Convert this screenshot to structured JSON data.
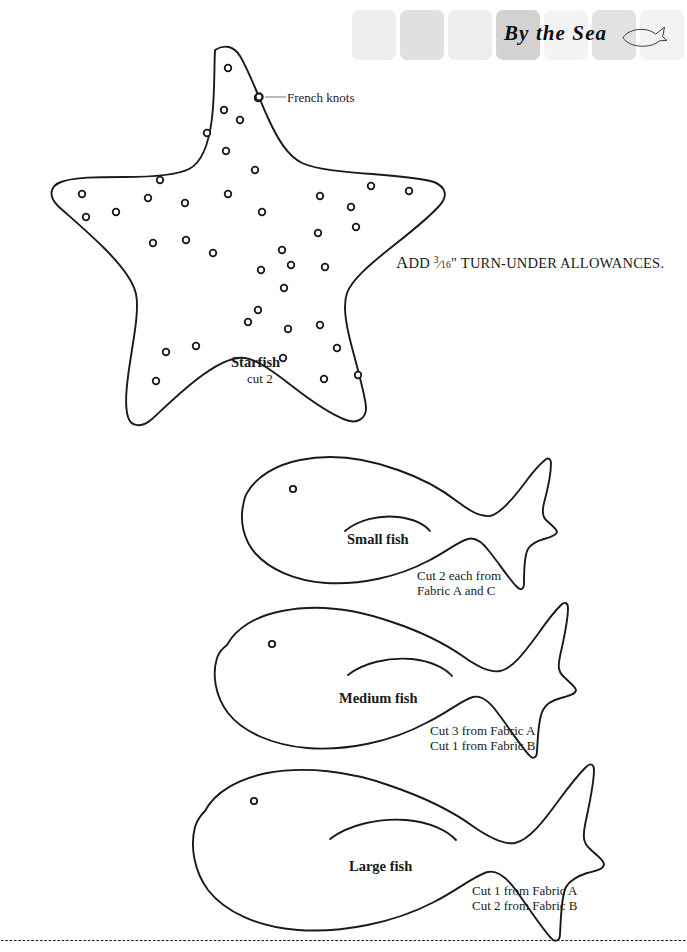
{
  "header": {
    "title": "By the Sea",
    "logo_icon": "fish-icon",
    "squares": [
      {
        "color": "#eeeeee",
        "x": 0
      },
      {
        "color": "#e0e0e0",
        "x": 48
      },
      {
        "color": "#ededed",
        "x": 96
      },
      {
        "color": "#d2d2d2",
        "x": 144
      },
      {
        "color": "#f4f4f4",
        "x": 192
      },
      {
        "color": "#e2e2e2",
        "x": 240
      },
      {
        "color": "#f2f2f2",
        "x": 288
      }
    ]
  },
  "notes": {
    "allowance_prefix": "A",
    "allowance_word": "DD",
    "allowance_fraction_num": "3",
    "allowance_fraction_den": "16",
    "allowance_inch": "\"",
    "allowance_suffix": "TURN-UNDER ALLOWANCES.",
    "french_knots": "French knots"
  },
  "patterns": [
    {
      "id": "starfish",
      "name": "Starfish",
      "cut_lines": [
        "cut 2"
      ],
      "marking": "french-knots"
    },
    {
      "id": "small-fish",
      "name": "Small fish",
      "cut_lines": [
        "Cut 2 each from",
        "Fabric A and C"
      ]
    },
    {
      "id": "medium-fish",
      "name": "Medium fish",
      "cut_lines": [
        "Cut 3 from Fabric A",
        "Cut 1 from Fabric B"
      ]
    },
    {
      "id": "large-fish",
      "name": "Large fish",
      "cut_lines": [
        "Cut 1 from Fabric A",
        "Cut 2 from Fabric B"
      ]
    }
  ],
  "colors": {
    "ink": "#1a1a1a",
    "paper": "#ffffff",
    "leader_line": "#8a8a8a"
  },
  "knot_points": [
    [
      228,
      68
    ],
    [
      224,
      110
    ],
    [
      240,
      120
    ],
    [
      258,
      98
    ],
    [
      207,
      133
    ],
    [
      226,
      151
    ],
    [
      160,
      180
    ],
    [
      82,
      194
    ],
    [
      116,
      212
    ],
    [
      148,
      198
    ],
    [
      86,
      217
    ],
    [
      153,
      243
    ],
    [
      185,
      203
    ],
    [
      228,
      194
    ],
    [
      255,
      170
    ],
    [
      262,
      212
    ],
    [
      261,
      270
    ],
    [
      186,
      240
    ],
    [
      213,
      253
    ],
    [
      258,
      310
    ],
    [
      282,
      250
    ],
    [
      284,
      288
    ],
    [
      320,
      196
    ],
    [
      318,
      233
    ],
    [
      325,
      267
    ],
    [
      320,
      325
    ],
    [
      371,
      186
    ],
    [
      409,
      191
    ],
    [
      351,
      207
    ],
    [
      356,
      227
    ],
    [
      288,
      329
    ],
    [
      248,
      322
    ],
    [
      283,
      358
    ],
    [
      196,
      346
    ],
    [
      166,
      352
    ],
    [
      337,
      348
    ],
    [
      358,
      375
    ],
    [
      324,
      379
    ],
    [
      156,
      381
    ],
    [
      291,
      265
    ]
  ]
}
